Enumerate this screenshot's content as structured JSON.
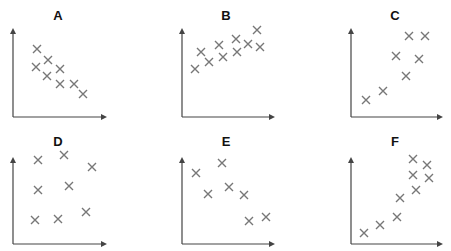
{
  "figure": {
    "panel_labels": [
      "A",
      "B",
      "C",
      "D",
      "E",
      "F"
    ]
  },
  "style": {
    "marker_color": "#777777",
    "axis_color": "#444444",
    "title_color": "#111111"
  },
  "chart_data": [
    {
      "type": "scatter",
      "title": "A",
      "xlabel": "",
      "ylabel": "",
      "grid": false,
      "marker": "x",
      "axis_box": {
        "origin": [
          13,
          117
        ],
        "y_top": 28,
        "x_end": 107
      },
      "points": [
        [
          37,
          49
        ],
        [
          48,
          60
        ],
        [
          36,
          67
        ],
        [
          60,
          69
        ],
        [
          47,
          76
        ],
        [
          60,
          84
        ],
        [
          74,
          84
        ],
        [
          83,
          94
        ]
      ],
      "description": "moderate negative correlation"
    },
    {
      "type": "scatter",
      "title": "B",
      "xlabel": "",
      "ylabel": "",
      "grid": false,
      "marker": "x",
      "axis_box": {
        "origin": [
          182,
          117
        ],
        "y_top": 28,
        "x_end": 275
      },
      "points": [
        [
          195,
          69
        ],
        [
          201,
          52
        ],
        [
          209,
          62
        ],
        [
          219,
          45
        ],
        [
          223,
          57
        ],
        [
          236,
          39
        ],
        [
          237,
          52
        ],
        [
          248,
          44
        ],
        [
          257,
          30
        ],
        [
          260,
          47
        ]
      ],
      "description": "weak positive correlation"
    },
    {
      "type": "scatter",
      "title": "C",
      "xlabel": "",
      "ylabel": "",
      "grid": false,
      "marker": "x",
      "axis_box": {
        "origin": [
          351,
          117
        ],
        "y_top": 28,
        "x_end": 443
      },
      "points": [
        [
          366,
          100
        ],
        [
          383,
          91
        ],
        [
          396,
          56
        ],
        [
          406,
          76
        ],
        [
          409,
          36
        ],
        [
          419,
          59
        ],
        [
          425,
          36
        ]
      ],
      "description": "strong positive correlation"
    },
    {
      "type": "scatter",
      "title": "D",
      "xlabel": "",
      "ylabel": "",
      "grid": false,
      "marker": "x",
      "axis_box": {
        "origin": [
          13,
          244
        ],
        "y_top": 157,
        "x_end": 107
      },
      "points": [
        [
          38,
          160
        ],
        [
          64,
          155
        ],
        [
          92,
          167
        ],
        [
          38,
          190
        ],
        [
          69,
          186
        ],
        [
          35,
          220
        ],
        [
          58,
          219
        ],
        [
          86,
          212
        ]
      ],
      "description": "no correlation"
    },
    {
      "type": "scatter",
      "title": "E",
      "xlabel": "",
      "ylabel": "",
      "grid": false,
      "marker": "x",
      "axis_box": {
        "origin": [
          182,
          244
        ],
        "y_top": 157,
        "x_end": 275
      },
      "points": [
        [
          196,
          173
        ],
        [
          222,
          163
        ],
        [
          208,
          194
        ],
        [
          229,
          187
        ],
        [
          244,
          195
        ],
        [
          249,
          221
        ],
        [
          266,
          217
        ]
      ],
      "description": "negative correlation"
    },
    {
      "type": "scatter",
      "title": "F",
      "xlabel": "",
      "ylabel": "",
      "grid": false,
      "marker": "x",
      "axis_box": {
        "origin": [
          351,
          244
        ],
        "y_top": 157,
        "x_end": 443
      },
      "points": [
        [
          364,
          233
        ],
        [
          380,
          225
        ],
        [
          397,
          217
        ],
        [
          400,
          198
        ],
        [
          413,
          159
        ],
        [
          413,
          175
        ],
        [
          416,
          190
        ],
        [
          427,
          165
        ],
        [
          429,
          178
        ]
      ],
      "description": "strong positive (curved) correlation"
    }
  ]
}
